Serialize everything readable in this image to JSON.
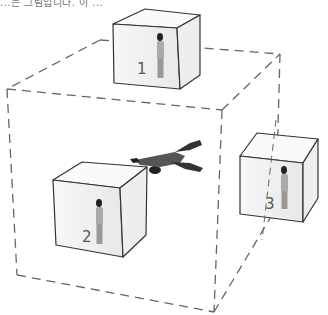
{
  "caption": "...는 그림입니다. 이 ...",
  "diagram": {
    "outer_cube": {
      "style": "dashed",
      "color": "#666666"
    },
    "boxes": [
      {
        "id": 1,
        "label": "1"
      },
      {
        "id": 2,
        "label": "2"
      },
      {
        "id": 3,
        "label": "3"
      }
    ],
    "flying_figure": "flying-person",
    "line_color": "#444444"
  }
}
